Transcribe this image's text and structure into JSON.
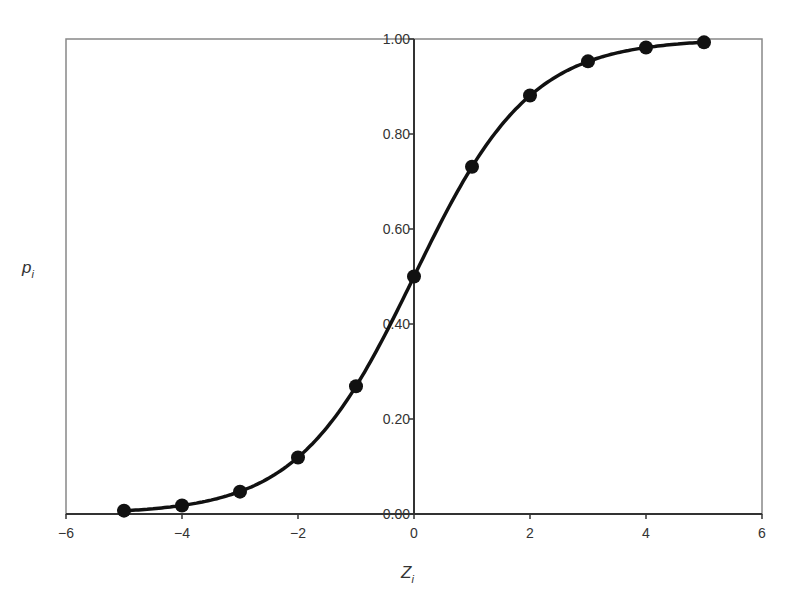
{
  "chart_data": {
    "type": "line",
    "title": "",
    "xlabel": "Z",
    "xlabel_subscript": "i",
    "ylabel": "p",
    "ylabel_subscript": "i",
    "xlim": [
      -6,
      6
    ],
    "ylim": [
      0,
      1
    ],
    "x_ticks": [
      -6,
      -4,
      -2,
      0,
      2,
      4,
      6
    ],
    "x_tick_labels": [
      "−6",
      "−4",
      "−2",
      "0",
      "2",
      "4",
      "6"
    ],
    "y_ticks": [
      0,
      0.2,
      0.4,
      0.6,
      0.8,
      1.0
    ],
    "y_tick_labels": [
      "0.00",
      "0.20",
      "0.40",
      "0.60",
      "0.80",
      "1.00"
    ],
    "grid": false,
    "legend": null,
    "series": [
      {
        "name": "logistic",
        "x": [
          -5,
          -4,
          -3,
          -2,
          -1,
          0,
          1,
          2,
          3,
          4,
          5
        ],
        "values": [
          0.007,
          0.018,
          0.047,
          0.119,
          0.269,
          0.5,
          0.731,
          0.881,
          0.953,
          0.982,
          0.993
        ],
        "marker": "circle",
        "smooth": true,
        "color": "#111111"
      }
    ]
  }
}
